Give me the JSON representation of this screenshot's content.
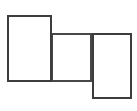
{
  "canvas": {
    "width": 137,
    "height": 111,
    "background_color": "#ffffff"
  },
  "diagram": {
    "type": "rectangles",
    "stroke_color": "#3d3d3d",
    "fill_color": "#ffffff",
    "stroke_width": 2,
    "shape_count": 3,
    "shapes": [
      {
        "name": "rectangle-left",
        "label": "",
        "x": 7,
        "y": 15,
        "width": 45,
        "height": 67,
        "fill": "#ffffff",
        "stroke": "#3d3d3d",
        "stroke_width": 2
      },
      {
        "name": "rectangle-middle",
        "label": "",
        "x": 51,
        "y": 33,
        "width": 41,
        "height": 49,
        "fill": "#ffffff",
        "stroke": "#484848",
        "stroke_width": 2
      },
      {
        "name": "rectangle-right",
        "label": "",
        "x": 92,
        "y": 33,
        "width": 40,
        "height": 66,
        "fill": "#ffffff",
        "stroke": "#3d3d3d",
        "stroke_width": 2
      }
    ]
  }
}
